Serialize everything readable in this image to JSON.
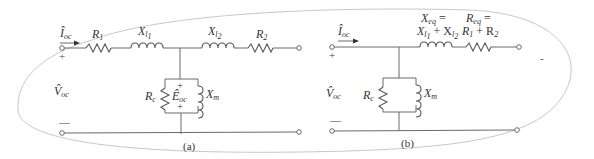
{
  "figure": {
    "panel_a": {
      "caption": "(a)",
      "current_label": "Î",
      "current_sub": "oc",
      "voltage_label": "V̂",
      "voltage_sub": "oc",
      "plus": "+",
      "minus": "—",
      "R1": {
        "main": "R",
        "sub": "1"
      },
      "Xl1": {
        "main": "X",
        "sub": "l",
        "subsub": "1"
      },
      "Xl2": {
        "main": "X",
        "sub": "l",
        "subsub": "2"
      },
      "R2": {
        "main": "R",
        "sub": "2"
      },
      "Rc": {
        "main": "R",
        "sub": "c"
      },
      "Xm": {
        "main": "X",
        "sub": "m"
      },
      "Eoc": {
        "main": "Ê",
        "sub": "oc"
      },
      "E_plus_top": "+",
      "E_plus_bottom": "+"
    },
    "panel_b": {
      "caption": "(b)",
      "current_label": "Î",
      "current_sub": "oc",
      "voltage_label": "V̂",
      "voltage_sub": "oc",
      "plus": "+",
      "minus": "—",
      "Xeq_line1": "X",
      "Xeq_line1_sub": "eq",
      "Xeq_line1_eq": " =",
      "Xeq_line2": "X",
      "Xeq_line2_plus": " + X",
      "Req_line1": "R",
      "Req_line1_sub": "eq",
      "Req_line1_eq": " =",
      "Req_line2_a": "R",
      "Req_line2_a_sub": "1",
      "Req_line2_plus": " + R",
      "Req_line2_b_sub": "2",
      "Rc": {
        "main": "R",
        "sub": "c"
      },
      "Xm": {
        "main": "X",
        "sub": "m"
      },
      "stray_mark": "-"
    }
  }
}
